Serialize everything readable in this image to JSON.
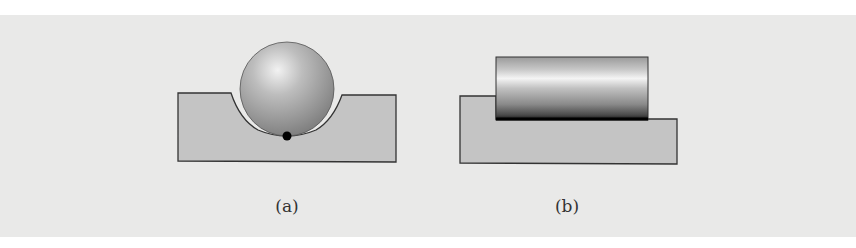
{
  "figure": {
    "panels": [
      {
        "id": "a",
        "label": "(a)",
        "description": "Sphere resting in a concave groove of a block, point contact marked with a dot"
      },
      {
        "id": "b",
        "label": "(b)",
        "description": "Cylinder resting flat on a stepped block, line contact along its bottom edge"
      }
    ],
    "colors": {
      "background_band": "#e9e9e8",
      "block_fill": "#c4c4c4",
      "outline": "#333333",
      "contact": "#000000"
    }
  }
}
